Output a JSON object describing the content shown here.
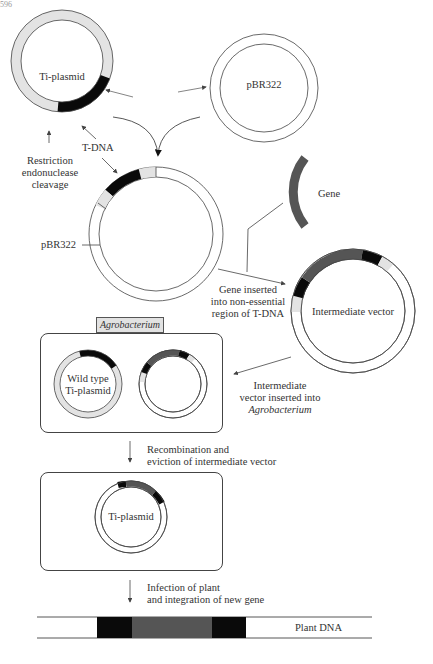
{
  "page_number": "596",
  "colors": {
    "light_gray_segment": "#e3e3e3",
    "black_segment": "#0a0a0a",
    "gene_segment": "#555555",
    "line": "#444444",
    "background": "#ffffff"
  },
  "labels": {
    "ti_plasmid_top": "Ti-plasmid",
    "pbr322_top": "pBR322",
    "restriction": [
      "Restriction",
      "endonuclease",
      "cleavage"
    ],
    "tdna": "T-DNA",
    "pbr322_side": "pBR322",
    "gene": "Gene",
    "gene_inserted": [
      "Gene inserted",
      "into non-essential",
      "region of T-DNA"
    ],
    "intermediate_vector": "Intermediate vector",
    "agrobacterium_tag": "Agrobacterium",
    "wild_type": [
      "Wild type",
      "Ti-plasmid"
    ],
    "inserted_into": [
      "Intermediate",
      "vector inserted into",
      "Agrobacterium"
    ],
    "recombination": [
      "Recombination and",
      "eviction of intermediate vector"
    ],
    "ti_plasmid_bottom": "Ti-plasmid",
    "infection": [
      "Infection of plant",
      "and integration of new gene"
    ],
    "plant_dna": "Plant DNA"
  },
  "steps": [
    "Ti-plasmid and pBR322 combined",
    "Gene inserted into non-essential region of T-DNA",
    "Intermediate vector inserted into Agrobacterium",
    "Recombination and eviction of intermediate vector",
    "Infection of plant and integration of new gene"
  ]
}
